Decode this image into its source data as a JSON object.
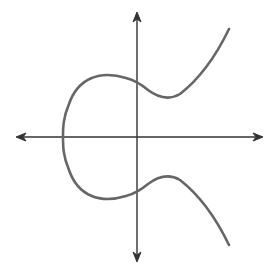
{
  "diagram": {
    "title": "Elliptic curve",
    "description": "Elliptic curve with two components (bounded loop and unbounded branch), symmetric about the x-axis, drawn on Cartesian axes with arrowheads",
    "colors": {
      "background": "#ffffff",
      "axes": "#333333",
      "curve": "#666666"
    },
    "axes": {
      "origin": [
        137,
        137
      ],
      "x_axis": {
        "from": [
          17,
          137
        ],
        "to": [
          262,
          137
        ],
        "arrows": "both"
      },
      "y_axis": {
        "from": [
          137,
          13
        ],
        "to": [
          137,
          261
        ],
        "arrows": "both"
      }
    },
    "curve": {
      "type": "elliptic-curve",
      "symmetry": "x-axis",
      "leftmost_point": [
        63,
        137
      ],
      "y_axis_crossings": [
        [
          137,
          82
        ],
        [
          137,
          192
        ]
      ],
      "local_extrema": [
        [
          112,
          75
        ],
        [
          169,
          97
        ],
        [
          169,
          177
        ],
        [
          112,
          199
        ]
      ],
      "endpoints": [
        [
          229,
          29
        ],
        [
          229,
          245
        ]
      ]
    }
  }
}
